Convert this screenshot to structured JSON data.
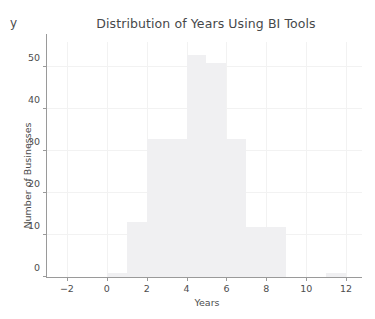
{
  "chart_data": {
    "type": "bar",
    "title": "Distribution of Years Using BI Tools",
    "xlabel": "Years",
    "ylabel": "Number of Businesses",
    "corner_label": "y",
    "xlim": [
      -3,
      12.8
    ],
    "ylim": [
      0,
      56
    ],
    "grid": true,
    "legend": null,
    "bin_width": 1,
    "bin_edges": [
      0,
      1,
      2,
      3,
      4,
      5,
      6,
      7,
      8,
      9,
      10,
      11,
      12
    ],
    "categories": [
      "0-1",
      "1-2",
      "2-3",
      "3-4",
      "4-5",
      "5-6",
      "6-7",
      "7-8",
      "8-9",
      "9-10",
      "10-11",
      "11-12"
    ],
    "x": [
      0.5,
      1.5,
      2.5,
      3.5,
      4.5,
      5.5,
      6.5,
      7.5,
      8.5,
      9.5,
      10.5,
      11.5
    ],
    "values": [
      1,
      13,
      33,
      33,
      53,
      51,
      33,
      12,
      12,
      0,
      0,
      1
    ],
    "xticks": [
      -2,
      0,
      2,
      4,
      6,
      8,
      10,
      12
    ],
    "xticklabels": [
      "−2",
      "0",
      "2",
      "4",
      "6",
      "8",
      "10",
      "12"
    ],
    "yticks": [
      0,
      10,
      20,
      30,
      40,
      50
    ],
    "yticklabels": [
      "0",
      "10",
      "20",
      "30",
      "40",
      "50"
    ],
    "bar_color": "#f0f0f2",
    "grid_color": "#f2f2f2",
    "axis_color": "#9a9a9a",
    "text_color": "#4d4d4d",
    "title_color": "#46484a",
    "background": "#ffffff"
  }
}
